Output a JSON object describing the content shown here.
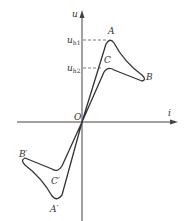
{
  "diagram": {
    "type": "voltage-current characteristic (snap-back / hysteresis curve)",
    "axes": {
      "x_label": "i",
      "y_label": "u",
      "origin_label": "O"
    },
    "levels": {
      "uh1": {
        "base": "u",
        "sub": "h1"
      },
      "uh2": {
        "base": "u",
        "sub": "h2"
      }
    },
    "points": {
      "A": "A",
      "B": "B",
      "C": "C",
      "A_prime": "A′",
      "B_prime": "B′",
      "C_prime": "C′"
    },
    "colors": {
      "line": "#333333",
      "axis": "#444444",
      "background": "#ffffff"
    }
  }
}
